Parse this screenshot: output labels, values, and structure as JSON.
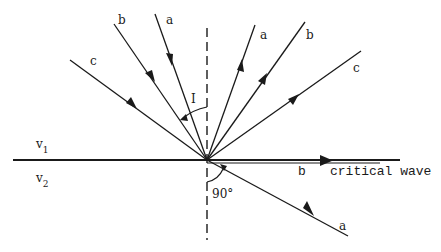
{
  "diagram": {
    "colors": {
      "ink": "#1a1a1a",
      "background": "#ffffff"
    },
    "labels": {
      "incident_a": "a",
      "incident_b": "b",
      "incident_c": "c",
      "reflected_a": "a",
      "reflected_b": "b",
      "reflected_c": "c",
      "refracted_a": "a",
      "critical_b": "b",
      "critical_wave": "critical wave",
      "angle_incidence": "I",
      "right_angle": "90°",
      "layer_upper": "v",
      "layer_upper_sub": "1",
      "layer_lower": "v",
      "layer_lower_sub": "2"
    },
    "rays": [
      {
        "id": "incident-a",
        "from": [
          155,
          14
        ],
        "to": [
          207,
          160
        ],
        "type": "incident"
      },
      {
        "id": "incident-b",
        "from": [
          114,
          24
        ],
        "to": [
          207,
          160
        ],
        "type": "incident"
      },
      {
        "id": "incident-c",
        "from": [
          70,
          60
        ],
        "to": [
          207,
          160
        ],
        "type": "incident"
      },
      {
        "id": "reflected-a",
        "from": [
          207,
          160
        ],
        "to": [
          255,
          25
        ],
        "type": "reflected"
      },
      {
        "id": "reflected-b",
        "from": [
          207,
          160
        ],
        "to": [
          305,
          22
        ],
        "type": "reflected"
      },
      {
        "id": "reflected-c",
        "from": [
          207,
          160
        ],
        "to": [
          361,
          51
        ],
        "type": "reflected"
      },
      {
        "id": "refracted-a",
        "from": [
          207,
          160
        ],
        "to": [
          348,
          236
        ],
        "type": "refracted"
      },
      {
        "id": "critical-b",
        "from": [
          207,
          160
        ],
        "to": [
          380,
          160
        ],
        "type": "critical"
      }
    ],
    "interface": {
      "from": [
        13,
        160
      ],
      "to": [
        400,
        160
      ]
    },
    "normal": {
      "x": 207,
      "y_top": 28,
      "y_bottom": 240
    }
  }
}
